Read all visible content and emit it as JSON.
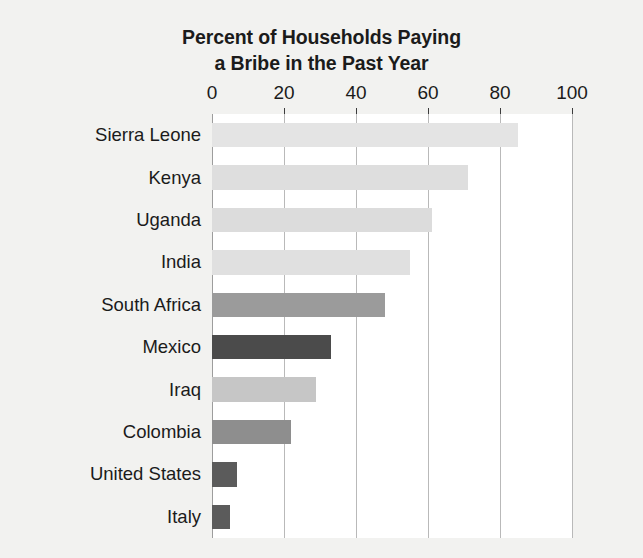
{
  "chart_data": {
    "type": "bar",
    "orientation": "horizontal",
    "title": "Percent of Households Paying a Bribe in the Past Year",
    "title_lines": [
      "Percent of Households Paying",
      "a Bribe in the Past Year"
    ],
    "xlabel": "",
    "ylabel": "",
    "xlim": [
      0,
      100
    ],
    "xticks": [
      0,
      20,
      40,
      60,
      80,
      100
    ],
    "xticklabels": [
      "0",
      "20",
      "40",
      "60",
      "80",
      "100"
    ],
    "grid": "vertical",
    "legend": "none",
    "categories": [
      "Sierra Leone",
      "Kenya",
      "Uganda",
      "India",
      "South Africa",
      "Mexico",
      "Iraq",
      "Colombia",
      "United States",
      "Italy"
    ],
    "values": [
      85,
      71,
      61,
      55,
      48,
      33,
      29,
      22,
      7,
      5
    ],
    "bar_colors": [
      "#e4e4e4",
      "#dedede",
      "#dcdcdc",
      "#e0e0e0",
      "#9b9b9b",
      "#4b4b4b",
      "#c6c6c6",
      "#8e8e8e",
      "#5b5b5b",
      "#5b5b5b"
    ],
    "bars": [
      {
        "category": "Sierra Leone",
        "value": 85,
        "color": "#e4e4e4"
      },
      {
        "category": "Kenya",
        "value": 71,
        "color": "#dedede"
      },
      {
        "category": "Uganda",
        "value": 61,
        "color": "#dcdcdc"
      },
      {
        "category": "India",
        "value": 55,
        "color": "#e0e0e0"
      },
      {
        "category": "South Africa",
        "value": 48,
        "color": "#9b9b9b"
      },
      {
        "category": "Mexico",
        "value": 33,
        "color": "#4b4b4b"
      },
      {
        "category": "Iraq",
        "value": 29,
        "color": "#c6c6c6"
      },
      {
        "category": "Colombia",
        "value": 22,
        "color": "#8e8e8e"
      },
      {
        "category": "United States",
        "value": 7,
        "color": "#5b5b5b"
      },
      {
        "category": "Italy",
        "value": 5,
        "color": "#5b5b5b"
      }
    ],
    "colors": {
      "figure_background": "#f2f2f0",
      "plot_background": "#ffffff",
      "gridline": "#b9b9b9",
      "text": "#1b1b1b"
    }
  }
}
